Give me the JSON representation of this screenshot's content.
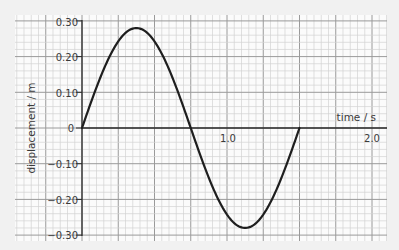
{
  "chart_data": {
    "type": "line",
    "title": "",
    "xlabel": "time / s",
    "ylabel": "displacement / m",
    "xlim": [
      -0.46,
      2.1
    ],
    "ylim": [
      -0.3,
      0.3
    ],
    "grid": true,
    "x_ticks": [
      {
        "value": 1.0,
        "label": "1.0"
      },
      {
        "value": 2.0,
        "label": "2.0"
      }
    ],
    "y_ticks": [
      {
        "value": 0.3,
        "label": "0.30"
      },
      {
        "value": 0.2,
        "label": "0.20"
      },
      {
        "value": 0.1,
        "label": "0.10"
      },
      {
        "value": 0,
        "label": "0"
      },
      {
        "value": -0.1,
        "label": "−0.10"
      },
      {
        "value": -0.2,
        "label": "−0.20"
      },
      {
        "value": -0.3,
        "label": "−0.30"
      }
    ],
    "series": [
      {
        "name": "displacement",
        "function": "0.28*sin(2*pi*t/1.5)",
        "amplitude": 0.28,
        "period": 1.5,
        "x": [
          0,
          0.125,
          0.25,
          0.375,
          0.5,
          0.625,
          0.75,
          0.875,
          1.0,
          1.125,
          1.25,
          1.375,
          1.5
        ],
        "values": [
          0,
          0.14,
          0.242,
          0.28,
          0.242,
          0.14,
          0,
          -0.14,
          -0.242,
          -0.28,
          -0.242,
          -0.14,
          0
        ]
      }
    ]
  },
  "labels": {
    "xlabel": "time / s",
    "ylabel": "displacement / m",
    "x_tick_1": "1.0",
    "x_tick_2": "2.0",
    "y_0": "0.30",
    "y_1": "0.20",
    "y_2": "0.10",
    "y_3": "0",
    "y_4": "−0.10",
    "y_5": "−0.20",
    "y_6": "−0.30"
  }
}
